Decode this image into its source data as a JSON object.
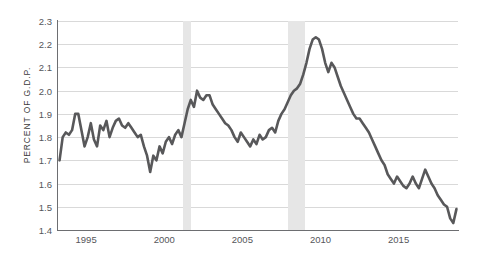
{
  "chart_data": {
    "type": "line",
    "title": "",
    "xlabel": "",
    "ylabel": "PERCENT OF G.D.P.",
    "xlim": [
      1993.2,
      2018.8
    ],
    "ylim": [
      1.4,
      2.3
    ],
    "grid": true,
    "legend": false,
    "line_color": "#58585a",
    "recession_band_color": "#e6e6e6",
    "gridline_color": "#d9d9d9",
    "axis_color": "#6d6e71",
    "y_ticks": [
      "2.3",
      "2.2",
      "2.1",
      "2.0",
      "1.9",
      "1.8",
      "1.7",
      "1.6",
      "1.5",
      "1.4"
    ],
    "y_tick_values": [
      2.3,
      2.2,
      2.1,
      2.0,
      1.9,
      1.8,
      1.7,
      1.6,
      1.5,
      1.4
    ],
    "x_ticks": [
      "1995",
      "2000",
      "2005",
      "2010",
      "2015"
    ],
    "x_tick_values": [
      1995,
      2000,
      2005,
      2010,
      2015
    ],
    "recession_bands": [
      {
        "start": 2001.2,
        "end": 2001.7
      },
      {
        "start": 2007.9,
        "end": 2009.0
      }
    ],
    "x": [
      1993.3,
      1993.5,
      1993.7,
      1993.9,
      1994.1,
      1994.3,
      1994.5,
      1994.7,
      1994.9,
      1995.1,
      1995.3,
      1995.5,
      1995.7,
      1995.9,
      1996.1,
      1996.3,
      1996.5,
      1996.7,
      1996.9,
      1997.1,
      1997.3,
      1997.5,
      1997.7,
      1997.9,
      1998.1,
      1998.3,
      1998.5,
      1998.7,
      1998.9,
      1999.1,
      1999.3,
      1999.5,
      1999.7,
      1999.9,
      2000.1,
      2000.3,
      2000.5,
      2000.7,
      2000.9,
      2001.1,
      2001.3,
      2001.5,
      2001.7,
      2001.9,
      2002.1,
      2002.3,
      2002.5,
      2002.7,
      2002.9,
      2003.1,
      2003.3,
      2003.5,
      2003.7,
      2003.9,
      2004.1,
      2004.3,
      2004.5,
      2004.7,
      2004.9,
      2005.1,
      2005.3,
      2005.5,
      2005.7,
      2005.9,
      2006.1,
      2006.3,
      2006.5,
      2006.7,
      2006.9,
      2007.1,
      2007.3,
      2007.5,
      2007.7,
      2007.9,
      2008.1,
      2008.3,
      2008.5,
      2008.7,
      2008.9,
      2009.1,
      2009.3,
      2009.5,
      2009.7,
      2009.9,
      2010.1,
      2010.3,
      2010.5,
      2010.7,
      2010.9,
      2011.1,
      2011.3,
      2011.5,
      2011.7,
      2011.9,
      2012.1,
      2012.3,
      2012.5,
      2012.7,
      2012.9,
      2013.1,
      2013.3,
      2013.5,
      2013.7,
      2013.9,
      2014.1,
      2014.3,
      2014.5,
      2014.7,
      2014.9,
      2015.1,
      2015.3,
      2015.5,
      2015.7,
      2015.9,
      2016.1,
      2016.3,
      2016.5,
      2016.7,
      2016.9,
      2017.1,
      2017.3,
      2017.5,
      2017.7,
      2017.9,
      2018.1,
      2018.3,
      2018.5,
      2018.7
    ],
    "values": [
      1.7,
      1.8,
      1.82,
      1.81,
      1.83,
      1.9,
      1.9,
      1.83,
      1.76,
      1.8,
      1.86,
      1.79,
      1.76,
      1.85,
      1.83,
      1.87,
      1.8,
      1.84,
      1.87,
      1.88,
      1.85,
      1.84,
      1.86,
      1.84,
      1.82,
      1.8,
      1.81,
      1.76,
      1.72,
      1.65,
      1.72,
      1.7,
      1.76,
      1.73,
      1.78,
      1.8,
      1.77,
      1.81,
      1.83,
      1.8,
      1.86,
      1.92,
      1.96,
      1.93,
      2.0,
      1.97,
      1.96,
      1.98,
      1.98,
      1.94,
      1.92,
      1.9,
      1.88,
      1.86,
      1.85,
      1.83,
      1.8,
      1.78,
      1.82,
      1.8,
      1.78,
      1.76,
      1.79,
      1.77,
      1.81,
      1.79,
      1.8,
      1.83,
      1.84,
      1.82,
      1.87,
      1.9,
      1.92,
      1.95,
      1.98,
      2.0,
      2.01,
      2.03,
      2.07,
      2.12,
      2.18,
      2.22,
      2.23,
      2.22,
      2.18,
      2.12,
      2.08,
      2.12,
      2.1,
      2.06,
      2.02,
      1.99,
      1.96,
      1.93,
      1.9,
      1.88,
      1.88,
      1.86,
      1.84,
      1.82,
      1.79,
      1.76,
      1.73,
      1.7,
      1.68,
      1.64,
      1.62,
      1.6,
      1.63,
      1.61,
      1.59,
      1.58,
      1.6,
      1.63,
      1.6,
      1.58,
      1.62,
      1.66,
      1.63,
      1.6,
      1.58,
      1.55,
      1.53,
      1.51,
      1.5,
      1.45,
      1.43,
      1.49
    ]
  },
  "axis_labels": {
    "y_title": "PERCENT OF G.D.P."
  }
}
